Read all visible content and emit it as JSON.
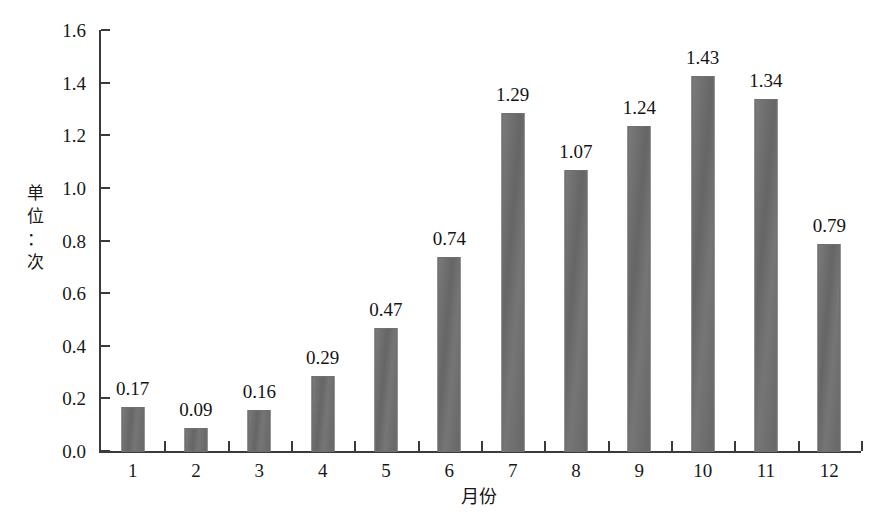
{
  "chart_data": {
    "type": "bar",
    "title": "",
    "xlabel": "月份",
    "ylabel": "单位：次",
    "ylabel_chars": "单\n位\n：\n次",
    "categories": [
      "1",
      "2",
      "3",
      "4",
      "5",
      "6",
      "7",
      "8",
      "9",
      "10",
      "11",
      "12"
    ],
    "values": [
      0.17,
      0.09,
      0.16,
      0.29,
      0.47,
      0.74,
      1.29,
      1.07,
      1.24,
      1.43,
      1.34,
      0.79
    ],
    "value_labels": [
      "0.17",
      "0.09",
      "0.16",
      "0.29",
      "0.47",
      "0.74",
      "1.29",
      "1.07",
      "1.24",
      "1.43",
      "1.34",
      "0.79"
    ],
    "ylim": [
      0.0,
      1.6
    ],
    "ytick_values": [
      0.0,
      0.2,
      0.4,
      0.6,
      0.8,
      1.0,
      1.2,
      1.4,
      1.6
    ],
    "ytick_labels": [
      "0.0",
      "0.2",
      "0.4",
      "0.6",
      "0.8",
      "1.0",
      "1.2",
      "1.4",
      "1.6"
    ],
    "grid": false,
    "legend": false,
    "bar_color": "#6b6b6b",
    "axis_color": "#3a3a3a",
    "text_color": "#181818",
    "background": "#ffffff"
  }
}
